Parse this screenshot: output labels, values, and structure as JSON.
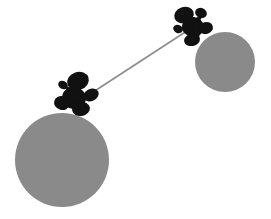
{
  "image": {
    "width": 271,
    "height": 219,
    "background_color": "#ffffff",
    "title": "Two gray spheres connected by a thin rod, each capped with a cluster of black blobs"
  },
  "palette": {
    "sphere_gray": "#8a8a8a",
    "blob_black": "#111111",
    "rod_gray": "#8c8c8c",
    "background": "#ffffff"
  },
  "chart_data": {
    "type": "scatter",
    "xlabel": "",
    "ylabel": "",
    "xlim": [
      0,
      271
    ],
    "ylim": [
      0,
      219
    ],
    "grid": false,
    "legend": "none",
    "series": [
      {
        "name": "spheres",
        "marker": "circle",
        "color": "#8a8a8a",
        "points": [
          {
            "label": "large-sphere",
            "cx": 62,
            "cy": 160,
            "r": 47
          },
          {
            "label": "small-sphere",
            "cx": 225,
            "cy": 62,
            "r": 30
          }
        ]
      },
      {
        "name": "connector-rod",
        "marker": "line",
        "color": "#8c8c8c",
        "points": [
          {
            "label": "rod-start",
            "x": 84,
            "y": 98
          },
          {
            "label": "rod-end",
            "x": 196,
            "y": 25
          }
        ]
      },
      {
        "name": "blob-cluster-lower-left",
        "marker": "blob",
        "color": "#111111",
        "points": [
          {
            "label": "blob-top",
            "cx": 78,
            "cy": 81,
            "rx": 11,
            "ry": 9,
            "rot": -18
          },
          {
            "label": "blob-left-dot",
            "cx": 63,
            "cy": 85,
            "rx": 5,
            "ry": 4,
            "rot": 30
          },
          {
            "label": "blob-center",
            "cx": 74,
            "cy": 98,
            "rx": 12,
            "ry": 11,
            "rot": 10
          },
          {
            "label": "blob-right",
            "cx": 91,
            "cy": 95,
            "rx": 8,
            "ry": 6,
            "rot": -25
          },
          {
            "label": "blob-lower-left",
            "cx": 62,
            "cy": 103,
            "rx": 8,
            "ry": 7,
            "rot": 15
          },
          {
            "label": "blob-lower-center",
            "cx": 81,
            "cy": 109,
            "rx": 9,
            "ry": 7,
            "rot": -10
          }
        ]
      },
      {
        "name": "blob-cluster-upper-right",
        "marker": "blob",
        "color": "#111111",
        "points": [
          {
            "label": "blob-top-left",
            "cx": 184,
            "cy": 15,
            "rx": 10,
            "ry": 8,
            "rot": -20
          },
          {
            "label": "blob-top-right",
            "cx": 201,
            "cy": 13,
            "rx": 6,
            "ry": 5,
            "rot": 20
          },
          {
            "label": "blob-center",
            "cx": 193,
            "cy": 27,
            "rx": 11,
            "ry": 10,
            "rot": 5
          },
          {
            "label": "blob-right",
            "cx": 206,
            "cy": 28,
            "rx": 7,
            "ry": 6,
            "rot": -15
          },
          {
            "label": "blob-left-dot",
            "cx": 178,
            "cy": 29,
            "rx": 5,
            "ry": 4,
            "rot": 25
          },
          {
            "label": "blob-bottom",
            "cx": 192,
            "cy": 40,
            "rx": 8,
            "ry": 6,
            "rot": -10
          }
        ]
      }
    ]
  }
}
